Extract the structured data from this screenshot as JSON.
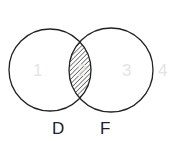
{
  "diagram": {
    "type": "venn",
    "sets": [
      {
        "label": "D",
        "cx": 50,
        "cy": 70,
        "r": 41
      },
      {
        "label": "F",
        "cx": 111,
        "cy": 70,
        "r": 42
      }
    ],
    "shaded_region": "D ∩ F",
    "region_numbers": [
      "1",
      "2",
      "3",
      "4"
    ],
    "colors": {
      "stroke": "#222222",
      "hatch": "#333333",
      "faint_numbers": "#e4e4e4"
    }
  }
}
